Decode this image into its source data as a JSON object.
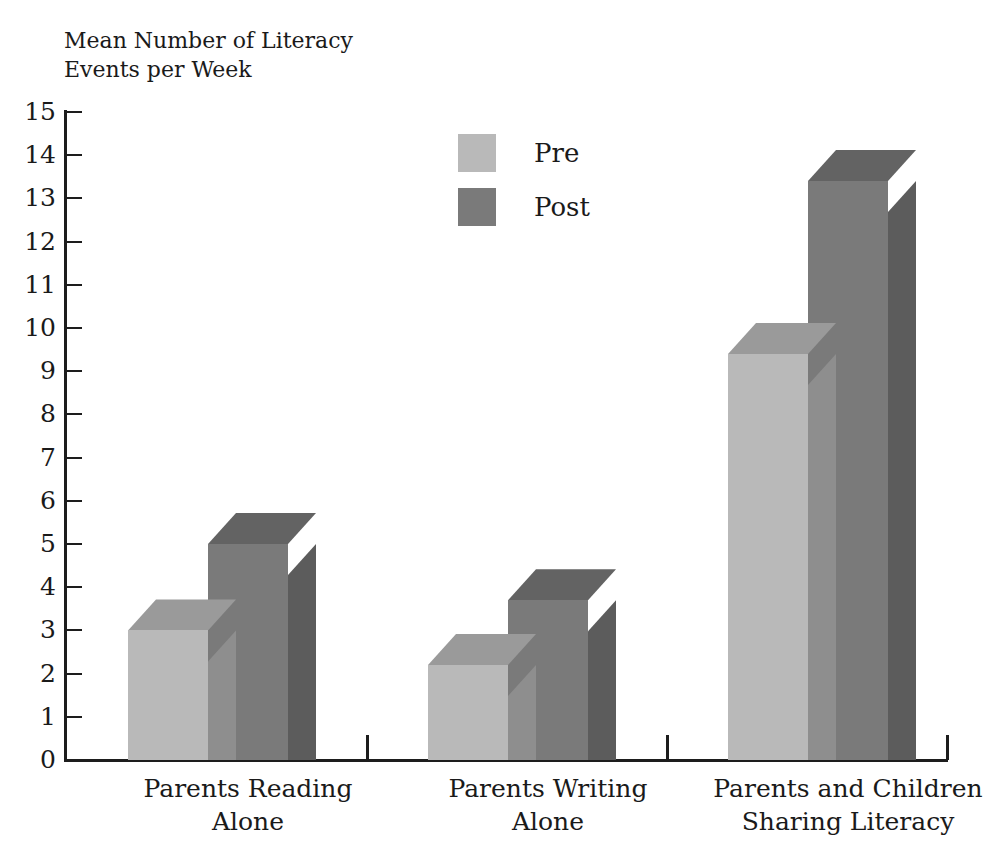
{
  "figure": {
    "cut_off_top_text": "",
    "axis_title": "Mean Number of Literacy\nEvents per Week"
  },
  "legend": {
    "position": "inside-top-center",
    "items": [
      {
        "label": "Pre",
        "color": "#b9b9b9"
      },
      {
        "label": "Post",
        "color": "#7a7a7a"
      }
    ]
  },
  "colors": {
    "pre_front": "#b9b9b9",
    "pre_top": "#9a9a9a",
    "pre_side": "#8e8e8e",
    "post_front": "#7a7a7a",
    "post_top": "#636363",
    "post_side": "#5c5c5c",
    "axis": "#1d1d1d",
    "text": "#1a1a1a",
    "background": "#ffffff"
  },
  "chart_data": {
    "type": "bar",
    "title": "",
    "subtitle": "",
    "xlabel": "",
    "ylabel": "Mean Number of Literacy Events per Week",
    "ylim": [
      0,
      15
    ],
    "ytick_step": 1,
    "yticks": [
      15,
      14,
      13,
      12,
      11,
      10,
      9,
      8,
      7,
      6,
      5,
      4,
      3,
      2,
      1,
      0
    ],
    "grid": false,
    "three_d": true,
    "legend_position": "inside-top-center",
    "categories": [
      "Parents Reading\nAlone",
      "Parents Writing\nAlone",
      "Parents and Children\nSharing Literacy"
    ],
    "series": [
      {
        "name": "Pre",
        "values": [
          3.0,
          2.2,
          9.4
        ]
      },
      {
        "name": "Post",
        "values": [
          5.0,
          3.7,
          13.4
        ]
      }
    ]
  },
  "axis_ticks": {
    "x_tick_positions_px": [
      366,
      666,
      946
    ]
  }
}
